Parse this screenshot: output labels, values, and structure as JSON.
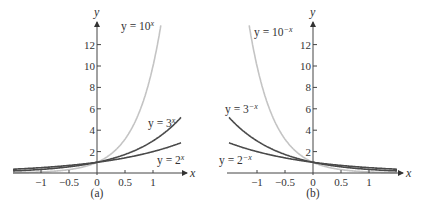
{
  "chart_data": [
    {
      "type": "line",
      "panel": "(a)",
      "title": "",
      "xlabel": "x",
      "ylabel": "y",
      "xlim": [
        -1.5,
        1.5
      ],
      "ylim": [
        0,
        14
      ],
      "grid": false,
      "x_ticks": [
        "-1",
        "-0.5",
        "0",
        "0.5",
        "1"
      ],
      "y_ticks": [
        "2",
        "4",
        "6",
        "8",
        "10",
        "12"
      ],
      "series": [
        {
          "name": "y = 10^x",
          "label_base": "y = 10",
          "label_exp": "x",
          "color": "#c4c4c4",
          "base": 10,
          "sign": 1
        },
        {
          "name": "y = 3^x",
          "label_base": "y = 3",
          "label_exp": "x",
          "color": "#4a4a4a",
          "base": 3,
          "sign": 1
        },
        {
          "name": "y = 2^x",
          "label_base": "y = 2",
          "label_exp": "x",
          "color": "#4a4a4a",
          "base": 2,
          "sign": 1
        }
      ],
      "caption": "(a)"
    },
    {
      "type": "line",
      "panel": "(b)",
      "title": "",
      "xlabel": "x",
      "ylabel": "y",
      "xlim": [
        -1.5,
        1.5
      ],
      "ylim": [
        0,
        14
      ],
      "grid": false,
      "x_ticks": [
        "-1",
        "-0.5",
        "0",
        "0.5",
        "1"
      ],
      "y_ticks": [
        "2",
        "4",
        "6",
        "8",
        "10",
        "12"
      ],
      "series": [
        {
          "name": "y = 10^-x",
          "label_base": "y = 10",
          "label_exp": "−x",
          "color": "#c4c4c4",
          "base": 10,
          "sign": -1
        },
        {
          "name": "y = 3^-x",
          "label_base": "y = 3",
          "label_exp": "−x",
          "color": "#4a4a4a",
          "base": 3,
          "sign": -1
        },
        {
          "name": "y = 2^-x",
          "label_base": "y = 2",
          "label_exp": "−x",
          "color": "#4a4a4a",
          "base": 2,
          "sign": -1
        }
      ],
      "caption": "(b)"
    }
  ],
  "labels": {
    "x_axis": "x",
    "y_axis": "y",
    "x_ticks": [
      "−1",
      "−0.5",
      "0",
      "0.5",
      "1"
    ],
    "y_ticks": [
      "2",
      "4",
      "6",
      "8",
      "10",
      "12"
    ],
    "a": {
      "ten": {
        "base": "y = 10",
        "exp": "x"
      },
      "three": {
        "base": "y = 3",
        "exp": "x"
      },
      "two": {
        "base": "y = 2",
        "exp": "x"
      },
      "caption": "(a)"
    },
    "b": {
      "ten": {
        "base": "y = 10",
        "exp": "−x"
      },
      "three": {
        "base": "y = 3",
        "exp": "−x"
      },
      "two": {
        "base": "y = 2",
        "exp": "−x"
      },
      "caption": "(b)"
    }
  }
}
